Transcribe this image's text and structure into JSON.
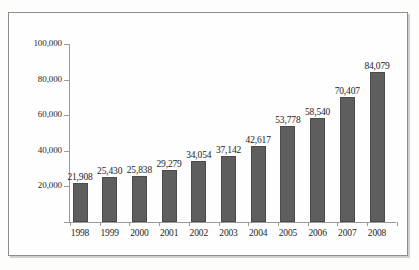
{
  "chart_data": {
    "type": "bar",
    "title": "",
    "subtitle": "",
    "xlabel": "",
    "ylabel": "",
    "categories": [
      "1998",
      "1999",
      "2000",
      "2001",
      "2002",
      "2003",
      "2004",
      "2005",
      "2006",
      "2007",
      "2008"
    ],
    "values": [
      21908,
      25430,
      25838,
      29279,
      34054,
      37142,
      42617,
      53778,
      58540,
      70407,
      84079
    ],
    "value_labels": [
      "21,908",
      "25,430",
      "25,838",
      "29,279",
      "34,054",
      "37,142",
      "42,617",
      "53,778",
      "58,540",
      "70,407",
      "84,079"
    ],
    "ylim": [
      0,
      100000
    ],
    "ytick_values": [
      100000,
      80000,
      60000,
      40000,
      20000,
      0
    ],
    "ytick_labels": [
      "100,000",
      "80,000",
      "60,000",
      "40,000",
      "20,000",
      ""
    ],
    "grid": false,
    "legend": null,
    "legend_position": "none",
    "series": [
      {
        "name": "",
        "values": [
          21908,
          25430,
          25838,
          29279,
          34054,
          37142,
          42617,
          53778,
          58540,
          70407,
          84079
        ]
      }
    ],
    "annotations": [],
    "colors": {
      "bar_fill": "#5e5e5e",
      "bar_edge": "#4a4a4a",
      "axis": "#9a9a9a",
      "text": "#1d1d1d",
      "frame": "#8d8d8d",
      "background": "#fefefe"
    }
  }
}
